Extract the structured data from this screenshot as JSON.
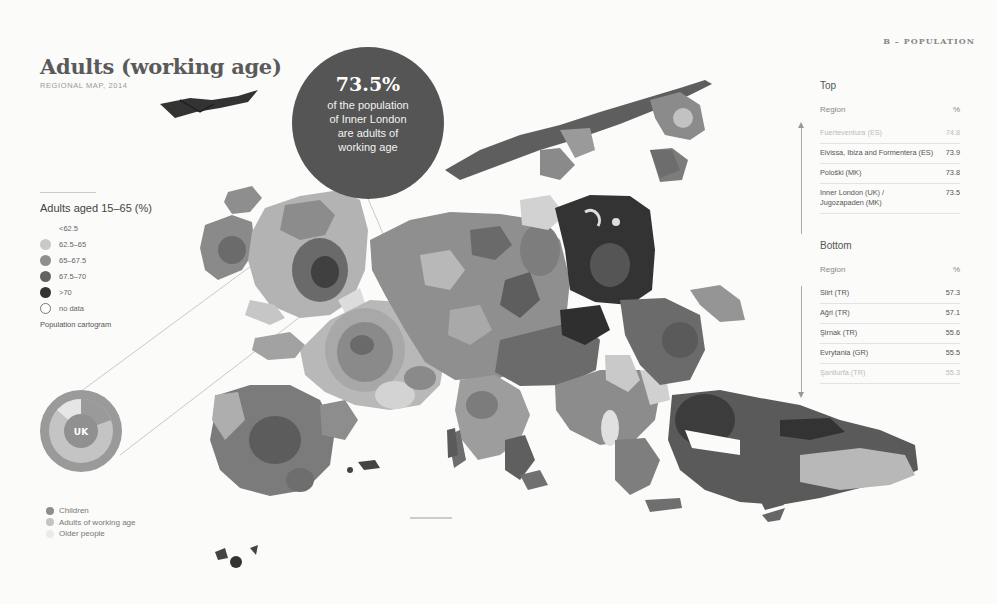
{
  "section_label": "B – POPULATION",
  "header": {
    "title": "Adults (working age)",
    "subtitle": "REGIONAL MAP, 2014"
  },
  "callout": {
    "value": "73.5%",
    "lines": [
      "of the population",
      "of Inner London",
      "are adults of",
      "working age"
    ]
  },
  "legend": {
    "title": "Adults aged 15–65 (%)",
    "items": [
      {
        "label": "<62.5",
        "color": "none",
        "icon": "no-swatch"
      },
      {
        "label": "62.5–65",
        "color": "#c9c9c9",
        "icon": "circle-swatch"
      },
      {
        "label": "65–67.5",
        "color": "#8f8f8f",
        "icon": "circle-swatch"
      },
      {
        "label": "67.5–70",
        "color": "#636363",
        "icon": "circle-swatch"
      },
      {
        "label": ">70",
        "color": "#333333",
        "icon": "circle-swatch"
      },
      {
        "label": "no data",
        "color": "#ffffff",
        "icon": "empty-circle"
      }
    ],
    "note": "Population cartogram"
  },
  "donut": {
    "center_label": "UK",
    "segments": [
      {
        "name": "Children",
        "color": "#8e8e8e"
      },
      {
        "name": "Adults of working age",
        "color": "#c4c4c4"
      },
      {
        "name": "Older people",
        "color": "#e6e6e6"
      }
    ],
    "legend": [
      {
        "label": "Children",
        "color": "#8e8e8e"
      },
      {
        "label": "Adults of working age",
        "color": "#c4c4c4"
      },
      {
        "label": "Older people",
        "color": "#ebebeb"
      }
    ]
  },
  "top_table": {
    "heading": "Top",
    "col_region": "Region",
    "col_pct": "%",
    "rows": [
      {
        "region": "Fuerteventura (ES)",
        "value": "74.8",
        "faded": true
      },
      {
        "region": "Eivissa, Ibiza and Formentera (ES)",
        "value": "73.9",
        "faded": false
      },
      {
        "region": "Pološki (MK)",
        "value": "73.8",
        "faded": false
      },
      {
        "region": "Inner London (UK) / Jugozapaden (MK)",
        "value": "73.5",
        "faded": false
      }
    ]
  },
  "bottom_table": {
    "heading": "Bottom",
    "col_region": "Region",
    "col_pct": "%",
    "rows": [
      {
        "region": "Siirt (TR)",
        "value": "57.3",
        "faded": false
      },
      {
        "region": "Ağri (TR)",
        "value": "57.1",
        "faded": false
      },
      {
        "region": "Şirnak (TR)",
        "value": "55.6",
        "faded": false
      },
      {
        "region": "Evrytania (GR)",
        "value": "55.5",
        "faded": false
      },
      {
        "region": "Şanliurfa (TR)",
        "value": "55.3",
        "faded": true
      }
    ]
  },
  "map": {
    "type": "population cartogram of European regions",
    "palette": [
      "#e6e6e6",
      "#c9c9c9",
      "#8f8f8f",
      "#636363",
      "#333333"
    ]
  }
}
